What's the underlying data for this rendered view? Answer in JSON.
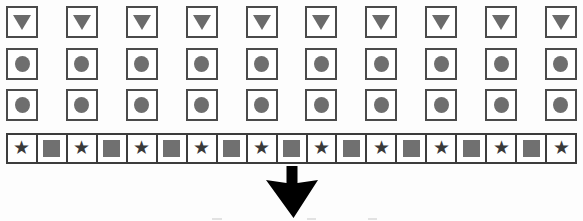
{
  "figure": {
    "title": "",
    "background_color": "#fdfdfd",
    "width": 583,
    "height": 221,
    "outline_color": "#3c3c3c",
    "fill_color": "#707070",
    "arrow_color": "#000000"
  },
  "rows": [
    {
      "id": "row-triangles",
      "top": 6,
      "count": 10,
      "glyph": "down-triangle-icon",
      "style": "spaced-boxes",
      "items": [
        {
          "glyph": "down-triangle-icon"
        },
        {
          "glyph": "down-triangle-icon"
        },
        {
          "glyph": "down-triangle-icon"
        },
        {
          "glyph": "down-triangle-icon"
        },
        {
          "glyph": "down-triangle-icon"
        },
        {
          "glyph": "down-triangle-icon"
        },
        {
          "glyph": "down-triangle-icon"
        },
        {
          "glyph": "down-triangle-icon"
        },
        {
          "glyph": "down-triangle-icon"
        },
        {
          "glyph": "down-triangle-icon"
        }
      ]
    },
    {
      "id": "row-circles-upper",
      "top": 48,
      "count": 10,
      "glyph": "filled-circle-icon",
      "style": "spaced-boxes",
      "items": [
        {
          "glyph": "filled-circle-icon"
        },
        {
          "glyph": "filled-circle-icon"
        },
        {
          "glyph": "filled-circle-icon"
        },
        {
          "glyph": "filled-circle-icon"
        },
        {
          "glyph": "filled-circle-icon"
        },
        {
          "glyph": "filled-circle-icon"
        },
        {
          "glyph": "filled-circle-icon"
        },
        {
          "glyph": "filled-circle-icon"
        },
        {
          "glyph": "filled-circle-icon"
        },
        {
          "glyph": "filled-circle-icon"
        }
      ]
    },
    {
      "id": "row-circles-lower",
      "top": 89,
      "count": 10,
      "glyph": "filled-circle-icon",
      "style": "spaced-boxes",
      "items": [
        {
          "glyph": "filled-circle-icon"
        },
        {
          "glyph": "filled-circle-icon"
        },
        {
          "glyph": "filled-circle-icon"
        },
        {
          "glyph": "filled-circle-icon"
        },
        {
          "glyph": "filled-circle-icon"
        },
        {
          "glyph": "filled-circle-icon"
        },
        {
          "glyph": "filled-circle-icon"
        },
        {
          "glyph": "filled-circle-icon"
        },
        {
          "glyph": "filled-circle-icon"
        },
        {
          "glyph": "filled-circle-icon"
        }
      ]
    }
  ],
  "strip": {
    "id": "row-star-square-strip",
    "top": 133,
    "count": 19,
    "pattern": "alternating star / filled-square, begins and ends with star",
    "star_char": "★",
    "items": [
      {
        "glyph": "star-icon"
      },
      {
        "glyph": "filled-square-icon"
      },
      {
        "glyph": "star-icon"
      },
      {
        "glyph": "filled-square-icon"
      },
      {
        "glyph": "star-icon"
      },
      {
        "glyph": "filled-square-icon"
      },
      {
        "glyph": "star-icon"
      },
      {
        "glyph": "filled-square-icon"
      },
      {
        "glyph": "star-icon"
      },
      {
        "glyph": "filled-square-icon"
      },
      {
        "glyph": "star-icon"
      },
      {
        "glyph": "filled-square-icon"
      },
      {
        "glyph": "star-icon"
      },
      {
        "glyph": "filled-square-icon"
      },
      {
        "glyph": "star-icon"
      },
      {
        "glyph": "filled-square-icon"
      },
      {
        "glyph": "star-icon"
      },
      {
        "glyph": "filled-square-icon"
      },
      {
        "glyph": "star-icon"
      }
    ]
  },
  "arrow": {
    "glyph": "down-arrow-icon",
    "label": "",
    "color": "#000000"
  }
}
